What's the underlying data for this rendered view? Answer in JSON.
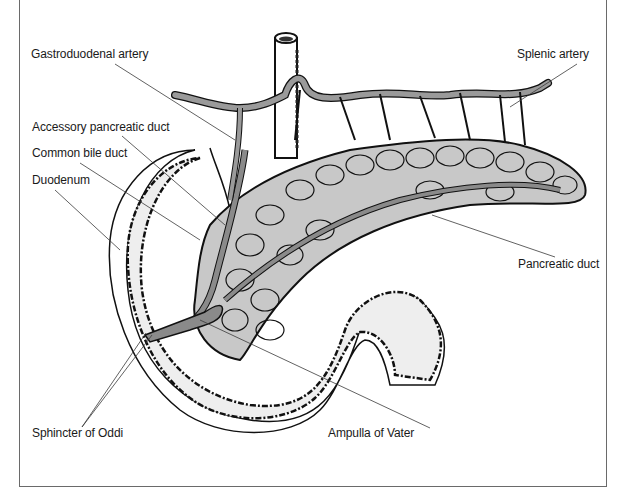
{
  "diagram": {
    "type": "anatomical-illustration",
    "labels": {
      "gastroduodenal_artery": "Gastroduodenal artery",
      "splenic_artery": "Splenic artery",
      "accessory_pancreatic_duct": "Accessory pancreatic duct",
      "common_bile_duct": "Common bile duct",
      "duodenum": "Duodenum",
      "pancreatic_duct": "Pancreatic duct",
      "sphincter_of_oddi": "Sphincter of Oddi",
      "ampulla_of_vater": "Ampulla of Vater"
    },
    "colors": {
      "outline": "#111111",
      "tissue_fill": "#c8c8c8",
      "vessel_fill": "#9a9a9a",
      "duct_fill": "#8a8a8a",
      "duodenum_fill": "#eeeeee",
      "leader_line": "#3a3a3a",
      "frame": "#6a6a6a"
    }
  }
}
